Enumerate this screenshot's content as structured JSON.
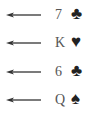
{
  "cards": [
    {
      "rank": "7",
      "suit": "clubs",
      "glyph": "♣"
    },
    {
      "rank": "K",
      "suit": "hearts",
      "glyph": "♥"
    },
    {
      "rank": "6",
      "suit": "clubs",
      "glyph": "♣"
    },
    {
      "rank": "Q",
      "suit": "spades",
      "glyph": "♠"
    }
  ],
  "arrow_direction": "left",
  "colors": {
    "text": "#555555",
    "suit": "#222222",
    "arrow": "#333333"
  }
}
